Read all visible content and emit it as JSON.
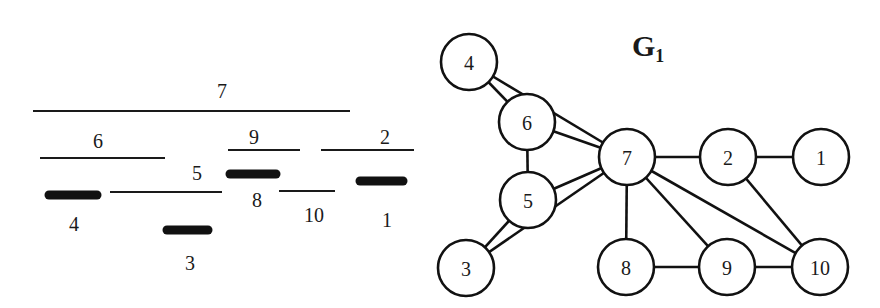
{
  "intervals": {
    "title": "",
    "items": [
      {
        "id": "7",
        "label": "7",
        "x1": 33,
        "x2": 350,
        "y": 111,
        "style": "thin",
        "label_x": 222,
        "label_y": 98
      },
      {
        "id": "6",
        "label": "6",
        "x1": 40,
        "x2": 165,
        "y": 158,
        "style": "thin",
        "label_x": 98,
        "label_y": 148
      },
      {
        "id": "9",
        "label": "9",
        "x1": 228,
        "x2": 300,
        "y": 150,
        "style": "thin",
        "label_x": 254,
        "label_y": 144
      },
      {
        "id": "2",
        "label": "2",
        "x1": 321,
        "x2": 414,
        "y": 150,
        "style": "thin",
        "label_x": 385,
        "label_y": 144
      },
      {
        "id": "5",
        "label": "5",
        "x1": 110,
        "x2": 222,
        "y": 192,
        "style": "thin",
        "label_x": 197,
        "label_y": 180
      },
      {
        "id": "8",
        "label": "8",
        "x1": 230,
        "x2": 276,
        "y": 174,
        "style": "thick",
        "label_x": 257,
        "label_y": 207
      },
      {
        "id": "4",
        "label": "4",
        "x1": 49,
        "x2": 97,
        "y": 195,
        "style": "thick",
        "label_x": 74,
        "label_y": 231
      },
      {
        "id": "10",
        "label": "10",
        "x1": 279,
        "x2": 335,
        "y": 191,
        "style": "thin",
        "label_x": 314,
        "label_y": 222
      },
      {
        "id": "1",
        "label": "1",
        "x1": 360,
        "x2": 403,
        "y": 181,
        "style": "thick",
        "label_x": 387,
        "label_y": 227
      },
      {
        "id": "3",
        "label": "3",
        "x1": 167,
        "x2": 208,
        "y": 230,
        "style": "thick",
        "label_x": 190,
        "label_y": 270
      }
    ]
  },
  "graph": {
    "title_main": "G",
    "title_sub": "1",
    "node_radius": 28,
    "nodes": [
      {
        "id": "4",
        "label": "4",
        "x": 469,
        "y": 62
      },
      {
        "id": "6",
        "label": "6",
        "x": 527,
        "y": 122
      },
      {
        "id": "7",
        "label": "7",
        "x": 627,
        "y": 157
      },
      {
        "id": "5",
        "label": "5",
        "x": 528,
        "y": 200
      },
      {
        "id": "3",
        "label": "3",
        "x": 466,
        "y": 268
      },
      {
        "id": "2",
        "label": "2",
        "x": 728,
        "y": 157
      },
      {
        "id": "1",
        "label": "1",
        "x": 821,
        "y": 157
      },
      {
        "id": "8",
        "label": "8",
        "x": 626,
        "y": 267
      },
      {
        "id": "9",
        "label": "9",
        "x": 727,
        "y": 267
      },
      {
        "id": "10",
        "label": "10",
        "x": 820,
        "y": 267
      }
    ],
    "edges": [
      [
        "4",
        "6"
      ],
      [
        "4",
        "7"
      ],
      [
        "6",
        "7"
      ],
      [
        "6",
        "5"
      ],
      [
        "5",
        "7"
      ],
      [
        "5",
        "3"
      ],
      [
        "3",
        "7"
      ],
      [
        "7",
        "2"
      ],
      [
        "7",
        "8"
      ],
      [
        "7",
        "9"
      ],
      [
        "7",
        "10"
      ],
      [
        "2",
        "1"
      ],
      [
        "2",
        "10"
      ],
      [
        "8",
        "9"
      ],
      [
        "9",
        "10"
      ]
    ]
  }
}
